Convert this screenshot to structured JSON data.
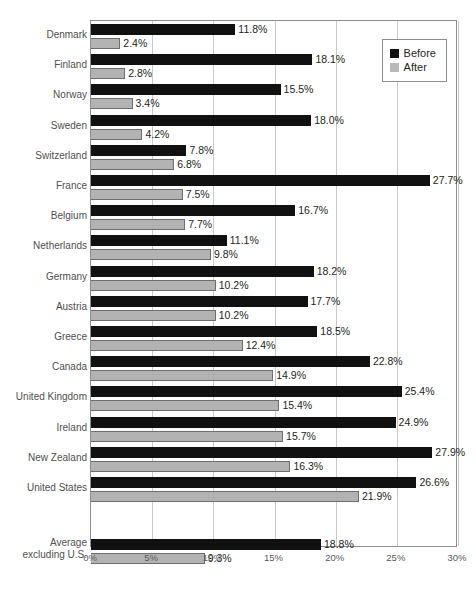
{
  "clipped_title": "",
  "legend": {
    "position": "top-right-inside",
    "items": [
      {
        "label": "Before",
        "color": "#111111",
        "swatch": "black-square-icon"
      },
      {
        "label": "After",
        "color": "#b9b9b9",
        "swatch": "gray-square-icon"
      }
    ]
  },
  "chart_data": {
    "type": "bar",
    "orientation": "horizontal",
    "title": "",
    "xlabel": "",
    "ylabel": "",
    "xlim": [
      0,
      30
    ],
    "xticks": [
      0,
      5,
      10,
      15,
      20,
      25,
      30
    ],
    "xtick_labels": [
      "0%",
      "5%",
      "10%",
      "15%",
      "20%",
      "25%",
      "30%"
    ],
    "grid": true,
    "value_suffix": "%",
    "categories": [
      "Denmark",
      "Finland",
      "Norway",
      "Sweden",
      "Switzerland",
      "France",
      "Belgium",
      "Netherlands",
      "Germany",
      "Austria",
      "Greece",
      "Canada",
      "United Kingdom",
      "Ireland",
      "New Zealand",
      "United States",
      "Average excluding U.S."
    ],
    "series": [
      {
        "name": "Before",
        "color": "#111111",
        "values": [
          11.8,
          18.1,
          15.5,
          18.0,
          7.8,
          27.7,
          16.7,
          11.1,
          18.2,
          17.7,
          18.5,
          22.8,
          25.4,
          24.9,
          27.9,
          26.6,
          18.8
        ],
        "labels": [
          "11.8%",
          "18.1%",
          "15.5%",
          "18.0%",
          "7.8%",
          "27.7%",
          "16.7%",
          "11.1%",
          "18.2%",
          "17.7%",
          "18.5%",
          "22.8%",
          "25.4%",
          "24.9%",
          "27.9%",
          "26.6%",
          "18.8%"
        ]
      },
      {
        "name": "After",
        "color": "#b3b3b3",
        "values": [
          2.4,
          2.8,
          3.4,
          4.2,
          6.8,
          7.5,
          7.7,
          9.8,
          10.2,
          10.2,
          12.4,
          14.9,
          15.4,
          15.7,
          16.3,
          21.9,
          9.3
        ],
        "labels": [
          "2.4%",
          "2.8%",
          "3.4%",
          "4.2%",
          "6.8%",
          "7.5%",
          "7.7%",
          "9.8%",
          "10.2%",
          "10.2%",
          "12.4%",
          "14.9%",
          "15.4%",
          "15.7%",
          "16.3%",
          "21.9%",
          "9.3%"
        ]
      }
    ]
  }
}
